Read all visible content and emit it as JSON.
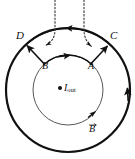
{
  "figure": {
    "type": "physics-diagram",
    "background_color": "#ffffff",
    "stroke_color": "#111111",
    "labels": {
      "point_d": "D",
      "point_c": "C",
      "point_b_inner": "B",
      "point_a_inner": "A",
      "current": "I",
      "current_subscript": "out",
      "field_vector": "B"
    },
    "geometry": {
      "center_x": 68,
      "center_y": 90,
      "inner_radius": 35,
      "outer_radius": 62,
      "inner_stroke_width": 0.9,
      "outer_stroke_width": 2.2,
      "current_dot_radius": 2.0,
      "current_dot_x": 60,
      "current_dot_y": 88
    },
    "arrows": {
      "outer_top_arc_direction": "leftward",
      "inner_top_arc_direction": "rightward",
      "outer_right_arc_direction": "upward",
      "inner_lower_right_direction": "counterclockwise",
      "radial_left_direction": "outward-to-D",
      "radial_right_direction": "outward-to-C",
      "dotted_left_direction": "down-left",
      "dotted_right_direction": "down-right"
    },
    "dotted_lines": {
      "count": 2,
      "left_x": 55,
      "right_x": 84,
      "top_y": 0,
      "style": "dotted"
    }
  }
}
